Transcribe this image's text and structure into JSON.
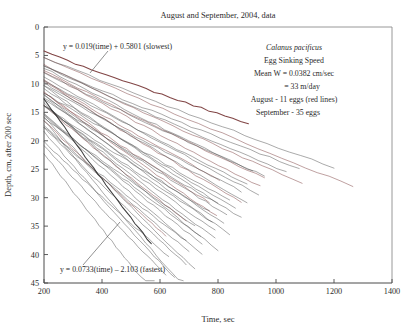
{
  "chart_data": {
    "type": "line",
    "title": "August and September, 2004, data",
    "xlabel": "Time, sec",
    "ylabel": "Depth, cm, after 200 sec",
    "xlim": [
      200,
      1400
    ],
    "ylim": [
      0,
      45
    ],
    "y_inverted": true,
    "grid": false,
    "legend_position": "none",
    "xticks": [
      200,
      400,
      600,
      800,
      1000,
      1200,
      1400
    ],
    "yticks": [
      0,
      5,
      10,
      15,
      20,
      25,
      30,
      35,
      40,
      45
    ],
    "annotations": [
      "y = 0.019(time) + 0.5801 (slowest)",
      "y = 0.0733(time) - 2.103 (fastest)",
      "Calanus pacificus",
      "Egg Sinking Speed",
      "Mean W = 0.0382 cm/sec",
      "= 33 m/day",
      "August - 11 eggs (red lines)",
      "September - 35 eggs"
    ],
    "series_count": 46,
    "series": [
      {
        "name": "August egg 1",
        "month": "August",
        "color": "#7a3b3b",
        "slope": 0.019,
        "intercept": 0.5801,
        "t_start": 200,
        "t_end": 905
      },
      {
        "name": "August egg 2",
        "month": "August",
        "color": "#7a3b3b",
        "slope": 0.0224,
        "intercept": 0.92,
        "t_start": 200,
        "t_end": 1265
      },
      {
        "name": "August egg 3",
        "month": "August",
        "color": "#7a3b3b",
        "slope": 0.0247,
        "intercept": 1.74,
        "t_start": 200,
        "t_end": 1090
      },
      {
        "name": "August egg 4",
        "month": "August",
        "color": "#7a3b3b",
        "slope": 0.0262,
        "intercept": 2.45,
        "t_start": 200,
        "t_end": 960
      },
      {
        "name": "August egg 5",
        "month": "August",
        "color": "#7a3b3b",
        "slope": 0.0286,
        "intercept": 2.1,
        "t_start": 200,
        "t_end": 945
      },
      {
        "name": "August egg 6",
        "month": "August",
        "color": "#7a3b3b",
        "slope": 0.0305,
        "intercept": 3.3,
        "t_start": 200,
        "t_end": 805
      },
      {
        "name": "August egg 7",
        "month": "August",
        "color": "#7a3b3b",
        "slope": 0.033,
        "intercept": 2.9,
        "t_start": 200,
        "t_end": 880
      },
      {
        "name": "August egg 8",
        "month": "August",
        "color": "#7a3b3b",
        "slope": 0.0358,
        "intercept": 4.4,
        "t_start": 200,
        "t_end": 770
      },
      {
        "name": "August egg 9",
        "month": "August",
        "color": "#7a3b3b",
        "slope": 0.0389,
        "intercept": 3.6,
        "t_start": 200,
        "t_end": 795
      },
      {
        "name": "August egg 10",
        "month": "August",
        "color": "#7a3b3b",
        "slope": 0.0437,
        "intercept": 5.1,
        "t_start": 200,
        "t_end": 690
      },
      {
        "name": "August egg 11",
        "month": "August",
        "color": "#7a3b3b",
        "slope": 0.0512,
        "intercept": 6.2,
        "t_start": 200,
        "t_end": 620
      },
      {
        "name": "September egg 1",
        "month": "September",
        "color": "#4d4d4d",
        "slope": 0.0205,
        "intercept": 1.25,
        "t_start": 200,
        "t_end": 1200
      },
      {
        "name": "September egg 2",
        "month": "September",
        "color": "#4d4d4d",
        "slope": 0.0216,
        "intercept": 2.6,
        "t_start": 200,
        "t_end": 1080
      },
      {
        "name": "September egg 3",
        "month": "September",
        "color": "#4d4d4d",
        "slope": 0.0235,
        "intercept": 2.2,
        "t_start": 200,
        "t_end": 1035
      },
      {
        "name": "September egg 4",
        "month": "September",
        "color": "#4d4d4d",
        "slope": 0.0252,
        "intercept": 3.05,
        "t_start": 200,
        "t_end": 960
      },
      {
        "name": "September egg 5",
        "month": "September",
        "color": "#4d4d4d",
        "slope": 0.0268,
        "intercept": 1.8,
        "t_start": 200,
        "t_end": 920
      },
      {
        "name": "September egg 6",
        "month": "September",
        "color": "#4d4d4d",
        "slope": 0.0275,
        "intercept": 3.9,
        "t_start": 200,
        "t_end": 900
      },
      {
        "name": "September egg 7",
        "month": "September",
        "color": "#4d4d4d",
        "slope": 0.0288,
        "intercept": 4.6,
        "t_start": 200,
        "t_end": 880
      },
      {
        "name": "September egg 8",
        "month": "September",
        "color": "#4d4d4d",
        "slope": 0.0296,
        "intercept": 2.8,
        "t_start": 200,
        "t_end": 940
      },
      {
        "name": "September egg 9",
        "month": "September",
        "color": "#4d4d4d",
        "slope": 0.031,
        "intercept": 5.4,
        "t_start": 200,
        "t_end": 840
      },
      {
        "name": "September egg 10",
        "month": "September",
        "color": "#4d4d4d",
        "slope": 0.0318,
        "intercept": 3.4,
        "t_start": 200,
        "t_end": 900
      },
      {
        "name": "September egg 11",
        "month": "September",
        "color": "#4d4d4d",
        "slope": 0.0326,
        "intercept": 6.1,
        "t_start": 200,
        "t_end": 800
      },
      {
        "name": "September egg 12",
        "month": "September",
        "color": "#4d4d4d",
        "slope": 0.0335,
        "intercept": 4.2,
        "t_start": 200,
        "t_end": 860
      },
      {
        "name": "September egg 13",
        "month": "September",
        "color": "#4d4d4d",
        "slope": 0.0344,
        "intercept": 7.0,
        "t_start": 200,
        "t_end": 770
      },
      {
        "name": "September egg 14",
        "month": "September",
        "color": "#4d4d4d",
        "slope": 0.0352,
        "intercept": 5.0,
        "t_start": 200,
        "t_end": 830
      },
      {
        "name": "September egg 15",
        "month": "September",
        "color": "#4d4d4d",
        "slope": 0.0361,
        "intercept": 3.1,
        "t_start": 200,
        "t_end": 880
      },
      {
        "name": "September egg 16",
        "month": "September",
        "color": "#4d4d4d",
        "slope": 0.037,
        "intercept": 6.6,
        "t_start": 200,
        "t_end": 780
      },
      {
        "name": "September egg 17",
        "month": "September",
        "color": "#4d4d4d",
        "slope": 0.0378,
        "intercept": 4.8,
        "t_start": 200,
        "t_end": 820
      },
      {
        "name": "September egg 18",
        "month": "September",
        "color": "#4d4d4d",
        "slope": 0.0386,
        "intercept": 8.2,
        "t_start": 200,
        "t_end": 720
      },
      {
        "name": "September egg 19",
        "month": "September",
        "color": "#4d4d4d",
        "slope": 0.0395,
        "intercept": 5.8,
        "t_start": 200,
        "t_end": 790
      },
      {
        "name": "September egg 20",
        "month": "September",
        "color": "#4d4d4d",
        "slope": 0.0404,
        "intercept": 3.9,
        "t_start": 200,
        "t_end": 840
      },
      {
        "name": "September egg 21",
        "month": "September",
        "color": "#4d4d4d",
        "slope": 0.0413,
        "intercept": 7.4,
        "t_start": 200,
        "t_end": 740
      },
      {
        "name": "September egg 22",
        "month": "September",
        "color": "#4d4d4d",
        "slope": 0.0422,
        "intercept": 5.2,
        "t_start": 200,
        "t_end": 790
      },
      {
        "name": "September egg 23",
        "month": "September",
        "color": "#4d4d4d",
        "slope": 0.0432,
        "intercept": 9.0,
        "t_start": 200,
        "t_end": 690
      },
      {
        "name": "September egg 24",
        "month": "September",
        "color": "#4d4d4d",
        "slope": 0.0444,
        "intercept": 6.4,
        "t_start": 200,
        "t_end": 745
      },
      {
        "name": "September egg 25",
        "month": "September",
        "color": "#4d4d4d",
        "slope": 0.0456,
        "intercept": 4.3,
        "t_start": 200,
        "t_end": 800
      },
      {
        "name": "September egg 26",
        "month": "September",
        "color": "#4d4d4d",
        "slope": 0.0468,
        "intercept": 8.0,
        "t_start": 200,
        "t_end": 700
      },
      {
        "name": "September egg 27",
        "month": "September",
        "color": "#4d4d4d",
        "slope": 0.0482,
        "intercept": 5.6,
        "t_start": 200,
        "t_end": 745
      },
      {
        "name": "September egg 28",
        "month": "September",
        "color": "#4d4d4d",
        "slope": 0.0498,
        "intercept": 10.2,
        "t_start": 200,
        "t_end": 630
      },
      {
        "name": "September egg 29",
        "month": "September",
        "color": "#4d4d4d",
        "slope": 0.052,
        "intercept": 7.2,
        "t_start": 200,
        "t_end": 690
      },
      {
        "name": "September egg 30",
        "month": "September",
        "color": "#4d4d4d",
        "slope": 0.0545,
        "intercept": 4.9,
        "t_start": 200,
        "t_end": 720
      },
      {
        "name": "September egg 31",
        "month": "September",
        "color": "#4d4d4d",
        "slope": 0.0572,
        "intercept": 9.4,
        "t_start": 200,
        "t_end": 620
      },
      {
        "name": "September egg 32",
        "month": "September",
        "color": "#4d4d4d",
        "slope": 0.0604,
        "intercept": 6.3,
        "t_start": 200,
        "t_end": 650
      },
      {
        "name": "September egg 33",
        "month": "September",
        "color": "#4d4d4d",
        "slope": 0.064,
        "intercept": 3.6,
        "t_start": 200,
        "t_end": 680
      },
      {
        "name": "September egg 34",
        "month": "September",
        "color": "#4d4d4d",
        "slope": 0.0685,
        "intercept": 8.5,
        "t_start": 200,
        "t_end": 580
      },
      {
        "name": "September egg 35",
        "month": "September",
        "color": "#333333",
        "slope": 0.0733,
        "intercept": -2.103,
        "t_start": 200,
        "t_end": 570
      }
    ]
  },
  "figure": {
    "title": "August and September, 2004, data",
    "x_axis": {
      "label": "Time, sec",
      "ticks": [
        "200",
        "400",
        "600",
        "800",
        "1000",
        "1200",
        "1400"
      ]
    },
    "y_axis": {
      "label": "Depth, cm, after 200 sec",
      "ticks": [
        "0",
        "5",
        "10",
        "15",
        "20",
        "25",
        "30",
        "35",
        "40",
        "45"
      ]
    },
    "equation_slowest": "y = 0.019(time) + 0.5801 (slowest)",
    "equation_fastest": "y = 0.0733(time) – 2.103 (fastest)",
    "info_block": {
      "species": "Calanus pacificus",
      "subject": "Egg Sinking Speed",
      "mean_w": "Mean W = 0.0382 cm/sec",
      "mean_w_alt": "= 33 m/day",
      "august": "August - 11 eggs (red lines)",
      "september": "September - 35 eggs"
    }
  }
}
